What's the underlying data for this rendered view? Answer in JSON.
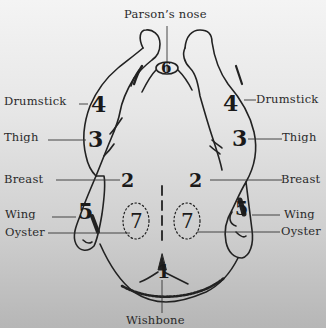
{
  "diagram": {
    "labels": {
      "parsons_nose": "Parson’s nose",
      "drumstick_left": "Drumstick",
      "drumstick_right": "Drumstick",
      "thigh_left": "Thigh",
      "thigh_right": "Thigh",
      "breast_left": "Breast",
      "breast_right": "Breast",
      "wing_left": "Wing",
      "wing_right": "Wing",
      "oyster_left": "Oyster",
      "oyster_right": "Oyster",
      "wishbone": "Wishbone"
    },
    "numbers": {
      "wishbone": "1",
      "breast_left": "2",
      "breast_right": "2",
      "thigh_left": "3",
      "thigh_right": "3",
      "drumstick_left": "4",
      "drumstick_right": "4",
      "wing_left": "5",
      "wing_right": "5",
      "parsons_nose": "6",
      "oyster_left": "7",
      "oyster_right": "7"
    },
    "colors": {
      "ink": "#1e1e1e",
      "background_top": "#f4f4f4",
      "background_bottom": "#b6b6b6"
    }
  }
}
